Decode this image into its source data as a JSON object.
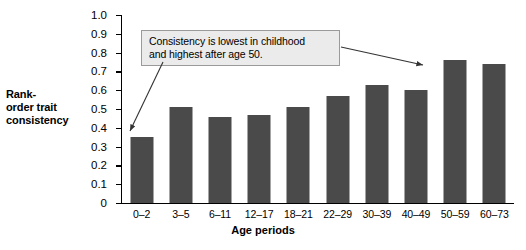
{
  "chart_data": {
    "type": "bar",
    "title": "",
    "xlabel": "Age periods",
    "ylabel": "Rank-order trait consistency",
    "ylabel_lines": [
      "Rank-",
      "order trait",
      "consistency"
    ],
    "categories": [
      "0–2",
      "3–5",
      "6–11",
      "12–17",
      "18–21",
      "22–29",
      "30–39",
      "40–49",
      "50–59",
      "60–73"
    ],
    "values": [
      0.35,
      0.51,
      0.46,
      0.47,
      0.51,
      0.57,
      0.63,
      0.6,
      0.76,
      0.74
    ],
    "ylim": [
      0,
      1.0
    ],
    "yticks": [
      0,
      0.1,
      0.2,
      0.3,
      0.4,
      0.5,
      0.6,
      0.7,
      0.8,
      0.9,
      1.0
    ],
    "ytick_labels": [
      "0",
      "0.1",
      "0.2",
      "0.3",
      "0.4",
      "0.5",
      "0.6",
      "0.7",
      "0.8",
      "0.9",
      "1.0"
    ],
    "grid": false,
    "legend": null,
    "bar_color": "#4a4a4a",
    "annotations": [
      {
        "text_lines": [
          "Consistency is lowest in childhood",
          "and highest after age 50."
        ],
        "text": "Consistency is lowest in childhood and highest after age 50.",
        "points_to": [
          "0–2",
          "50–59"
        ]
      }
    ]
  }
}
